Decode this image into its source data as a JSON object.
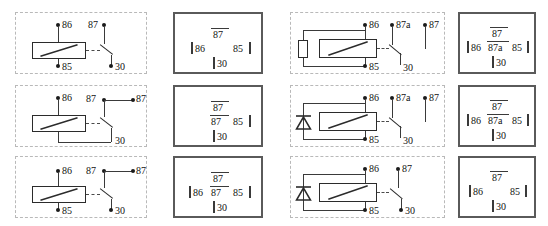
{
  "diagram": {
    "columns": 4,
    "rows": 3,
    "pin_labels": {
      "coil_plus": "86",
      "coil_minus": "85",
      "common": "30",
      "no_contact": "87",
      "nc_contact": "87a"
    }
  },
  "cells": [
    {
      "id": "r1c1",
      "kind": "schematic",
      "suppressor": "none",
      "has_85_dot": true,
      "contact_type": "spst-no",
      "labels": {
        "coil_plus": "86",
        "coil_minus": "85",
        "contact_top": "87",
        "contact_extra": "",
        "common": "30"
      }
    },
    {
      "id": "r1c2",
      "kind": "pinout",
      "top": "87",
      "left": "86",
      "middle": "",
      "right": "85",
      "bottom": "30"
    },
    {
      "id": "r1c3",
      "kind": "schematic",
      "suppressor": "resistor",
      "has_85_dot": true,
      "contact_type": "spdt",
      "labels": {
        "coil_plus": "86",
        "coil_minus": "85",
        "contact_top": "87a",
        "contact_extra": "87",
        "common": "30"
      }
    },
    {
      "id": "r1c4",
      "kind": "pinout",
      "top": "87",
      "left": "86",
      "middle": "87a",
      "right": "85",
      "bottom": "30"
    },
    {
      "id": "r2c1",
      "kind": "schematic",
      "suppressor": "none",
      "has_85_dot": false,
      "contact_type": "spst-no-bridged",
      "labels": {
        "coil_plus": "86",
        "coil_minus": "",
        "contact_top": "87",
        "contact_extra": "87",
        "common": "30"
      }
    },
    {
      "id": "r2c2",
      "kind": "pinout",
      "top": "87",
      "left": "",
      "middle": "87",
      "right": "85",
      "bottom": "30"
    },
    {
      "id": "r2c3",
      "kind": "schematic",
      "suppressor": "diode",
      "has_85_dot": true,
      "contact_type": "spdt",
      "labels": {
        "coil_plus": "86",
        "coil_minus": "85",
        "contact_top": "87a",
        "contact_extra": "87",
        "common": "30"
      }
    },
    {
      "id": "r2c4",
      "kind": "pinout",
      "top": "87",
      "left": "86",
      "middle": "87a",
      "right": "85",
      "bottom": "30"
    },
    {
      "id": "r3c1",
      "kind": "schematic",
      "suppressor": "none",
      "has_85_dot": true,
      "contact_type": "spst-no-bridged",
      "labels": {
        "coil_plus": "86",
        "coil_minus": "85",
        "contact_top": "87",
        "contact_extra": "87",
        "common": "30"
      }
    },
    {
      "id": "r3c2",
      "kind": "pinout",
      "top": "87",
      "left": "86",
      "middle": "87",
      "right": "85",
      "bottom": "30"
    },
    {
      "id": "r3c3",
      "kind": "schematic",
      "suppressor": "diode",
      "has_85_dot": true,
      "contact_type": "spst-no",
      "labels": {
        "coil_plus": "86",
        "coil_minus": "85",
        "contact_top": "87",
        "contact_extra": "",
        "common": "30"
      }
    },
    {
      "id": "r3c4",
      "kind": "pinout",
      "top": "87",
      "left": "86",
      "middle": "",
      "right": "85",
      "bottom": "30"
    }
  ]
}
